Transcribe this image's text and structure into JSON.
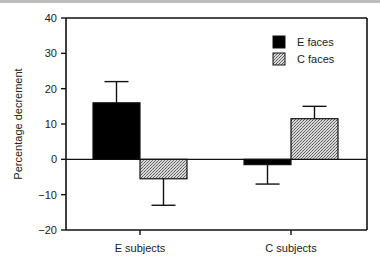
{
  "chart_data": {
    "type": "bar",
    "title": "",
    "xlabel": "",
    "ylabel": "Percentage decrement",
    "ylim": [
      -20,
      40
    ],
    "yticks": [
      -20,
      -10,
      0,
      10,
      20,
      30,
      40
    ],
    "ytick_labels": [
      "−20",
      "−10",
      "0",
      "10",
      "20",
      "30",
      "40"
    ],
    "categories": [
      "E subjects",
      "C subjects"
    ],
    "series": [
      {
        "name": "E faces",
        "fill": "solid",
        "color": "#000000",
        "values": [
          16,
          -1.5
        ],
        "error_ends": [
          22,
          -7
        ]
      },
      {
        "name": "C faces",
        "fill": "stipple",
        "color": "#a8a8a8",
        "values": [
          -5.5,
          11.5
        ],
        "error_ends": [
          -13,
          15
        ]
      }
    ],
    "legend": {
      "placement": "top-right",
      "entries": [
        "E faces",
        "C faces"
      ]
    },
    "grid": false,
    "zero_line": true
  }
}
